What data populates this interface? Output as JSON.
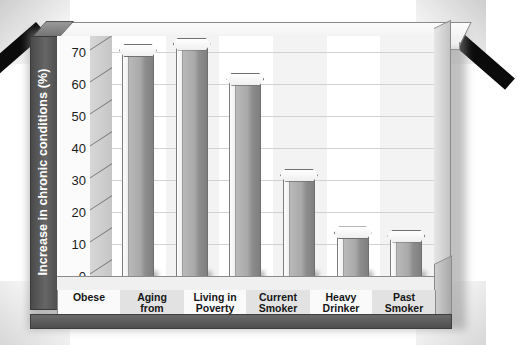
{
  "chart_data": {
    "type": "bar",
    "title": "",
    "xlabel": "",
    "ylabel": "Increase in chronic conditions (%)",
    "ylim": [
      0,
      75
    ],
    "yticks": [
      0,
      10,
      20,
      30,
      40,
      50,
      60,
      70
    ],
    "grid": true,
    "legend": "none",
    "style": "3d-hexagonal-prism-bars-grayscale",
    "categories": [
      "Obese",
      "Aging from 30 to 50",
      "Living in Poverty",
      "Current Smoker",
      "Heavy Drinker",
      "Past Smoker"
    ],
    "category_lines": [
      [
        "Obese"
      ],
      [
        "Aging",
        "from",
        "30 to 50"
      ],
      [
        "Living in",
        "Poverty"
      ],
      [
        "Current",
        "Smoker"
      ],
      [
        "Heavy",
        "Drinker"
      ],
      [
        "Past",
        "Smoker"
      ]
    ],
    "values": [
      70,
      72,
      61,
      31,
      13,
      12
    ]
  },
  "axis": {
    "y_title": "Increase in chronic conditions (%)",
    "tick_labels": [
      "70",
      "60",
      "50",
      "40",
      "30",
      "20",
      "10",
      "0"
    ]
  },
  "colors": {
    "axis_band": "#5a5a5a",
    "axis_title_text": "#ffffff",
    "bar_front": "#a9a9a9",
    "bar_light": "#fdfdfd",
    "bar_dark": "#7f7f7f",
    "plot_background": "#ffffff",
    "gridline": "#d2d2d2",
    "band_alt": "#e2e2e2",
    "plinth": "#5a5a5a",
    "scan_artifact": "#0b0b0b",
    "page_background": "#ffffff"
  }
}
